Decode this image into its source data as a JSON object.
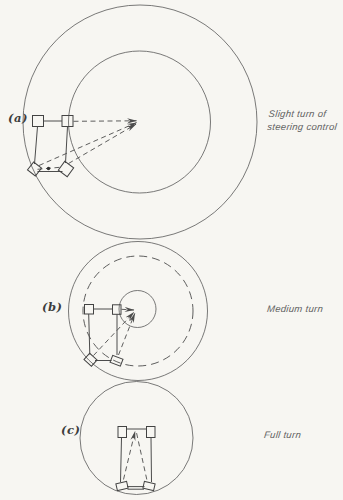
{
  "canvas": {
    "width": 343,
    "height": 500,
    "background_color": "#f7f6f2",
    "line_color": "#4c4c4c",
    "text_color": "#606060"
  },
  "diagram": {
    "type": "vehicle-turning-circles"
  },
  "figures": [
    {
      "label": "(a)",
      "caption_lines": [
        "Slight turn of",
        "steering control"
      ],
      "turn_amount": "slight",
      "center_px": [
        140,
        122
      ],
      "circles": [
        {
          "style": "solid",
          "radius_px": 117,
          "meaning": "outer-front-wheel-path"
        },
        {
          "style": "solid",
          "radius_px": 71,
          "meaning": "inner-rear-wheel-path"
        }
      ],
      "has_axle_midpoint_dot": true
    },
    {
      "label": "(b)",
      "caption_lines": [
        "Medium turn"
      ],
      "turn_amount": "medium",
      "center_px": [
        138,
        311
      ],
      "circles": [
        {
          "style": "solid",
          "radius_px": 69.5,
          "meaning": "outer-front-wheel-path"
        },
        {
          "style": "dashed",
          "radius_px": 55,
          "meaning": "inner-front-wheel-path"
        },
        {
          "style": "solid",
          "radius_px": 18.5,
          "meaning": "inner-rear-wheel-path"
        }
      ],
      "has_axle_midpoint_dot": false
    },
    {
      "label": "(c)",
      "caption_lines": [
        "Full turn"
      ],
      "turn_amount": "full",
      "center_px": [
        136.5,
        438
      ],
      "circles": [
        {
          "style": "solid",
          "radius_px": 56.5,
          "meaning": "overall-turning-circle"
        }
      ],
      "has_axle_midpoint_dot": false
    }
  ]
}
